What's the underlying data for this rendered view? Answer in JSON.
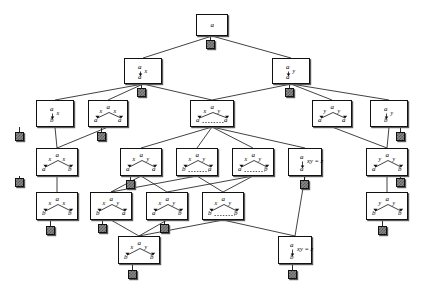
{
  "figure": {
    "type": "tree-diagram",
    "background": "#ffffff",
    "line_color": "#111111",
    "box_fill": "#ffffff",
    "terminal_fill": "#8a8a8a"
  },
  "glyphs": {
    "a": "a",
    "b": "b",
    "x": "x",
    "y": "y",
    "xyz": "xy = z"
  },
  "nodes": [
    {
      "id": "n0",
      "x": 196,
      "y": 14,
      "w": 32,
      "h": 22,
      "kind": "single",
      "top": "a",
      "down": "",
      "left_edge": "",
      "right_edge": "",
      "left_child": "",
      "right_child": "",
      "dashed": false,
      "note": ""
    },
    {
      "id": "n1",
      "x": 124,
      "y": 58,
      "w": 38,
      "h": 26,
      "kind": "arrow",
      "top": "a",
      "down": "a",
      "left_edge": "",
      "right_edge": "x",
      "left_child": "",
      "right_child": "",
      "dashed": false,
      "note": ""
    },
    {
      "id": "n2",
      "x": 272,
      "y": 58,
      "w": 38,
      "h": 26,
      "kind": "arrow",
      "top": "a",
      "down": "a",
      "left_edge": "",
      "right_edge": "y",
      "left_child": "",
      "right_child": "",
      "dashed": false,
      "note": ""
    },
    {
      "id": "n3",
      "x": 36,
      "y": 100,
      "w": 38,
      "h": 27,
      "kind": "arrow",
      "top": "a",
      "down": "b",
      "left_edge": "",
      "right_edge": "x",
      "left_child": "",
      "right_child": "",
      "dashed": false,
      "note": ""
    },
    {
      "id": "n4",
      "x": 88,
      "y": 100,
      "w": 40,
      "h": 27,
      "kind": "fork",
      "top": "a",
      "down": "",
      "left_edge": "x",
      "right_edge": "x",
      "left_child": "a",
      "right_child": "a",
      "dashed": false,
      "note": ""
    },
    {
      "id": "n5",
      "x": 190,
      "y": 100,
      "w": 44,
      "h": 27,
      "kind": "fork",
      "top": "a",
      "down": "",
      "left_edge": "x",
      "right_edge": "y",
      "left_child": "a",
      "right_child": "a",
      "dashed": true,
      "note": ""
    },
    {
      "id": "n6",
      "x": 312,
      "y": 100,
      "w": 40,
      "h": 27,
      "kind": "fork",
      "top": "a",
      "down": "",
      "left_edge": "y",
      "right_edge": "y",
      "left_child": "a",
      "right_child": "a",
      "dashed": false,
      "note": ""
    },
    {
      "id": "n7",
      "x": 370,
      "y": 100,
      "w": 38,
      "h": 27,
      "kind": "arrow",
      "top": "a",
      "down": "b",
      "left_edge": "",
      "right_edge": "y",
      "left_child": "",
      "right_child": "",
      "dashed": false,
      "note": ""
    },
    {
      "id": "n8",
      "x": 36,
      "y": 148,
      "w": 42,
      "h": 28,
      "kind": "fork",
      "top": "a",
      "down": "",
      "left_edge": "x",
      "right_edge": "x",
      "left_child": "a",
      "right_child": "b",
      "dashed": false,
      "note": ""
    },
    {
      "id": "n9",
      "x": 120,
      "y": 148,
      "w": 42,
      "h": 28,
      "kind": "fork",
      "top": "a",
      "down": "",
      "left_edge": "x",
      "right_edge": "y",
      "left_child": "a",
      "right_child": "a",
      "dashed": false,
      "note": ""
    },
    {
      "id": "n10",
      "x": 176,
      "y": 148,
      "w": 42,
      "h": 28,
      "kind": "fork",
      "top": "a",
      "down": "",
      "left_edge": "x",
      "right_edge": "y",
      "left_child": "b",
      "right_child": "a",
      "dashed": true,
      "note": ""
    },
    {
      "id": "n11",
      "x": 232,
      "y": 148,
      "w": 42,
      "h": 28,
      "kind": "fork",
      "top": "a",
      "down": "",
      "left_edge": "x",
      "right_edge": "y",
      "left_child": "a",
      "right_child": "b",
      "dashed": true,
      "note": ""
    },
    {
      "id": "n12",
      "x": 288,
      "y": 148,
      "w": 34,
      "h": 28,
      "kind": "eqarrow",
      "top": "a",
      "down": "a",
      "left_edge": "",
      "right_edge": "",
      "left_child": "",
      "right_child": "",
      "dashed": false,
      "note": "xy = z"
    },
    {
      "id": "n13",
      "x": 366,
      "y": 148,
      "w": 42,
      "h": 28,
      "kind": "fork",
      "top": "a",
      "down": "",
      "left_edge": "y",
      "right_edge": "y",
      "left_child": "a",
      "right_child": "b",
      "dashed": false,
      "note": ""
    },
    {
      "id": "n14",
      "x": 36,
      "y": 192,
      "w": 42,
      "h": 28,
      "kind": "fork",
      "top": "a",
      "down": "",
      "left_edge": "x",
      "right_edge": "x",
      "left_child": "b",
      "right_child": "b",
      "dashed": false,
      "note": ""
    },
    {
      "id": "n15",
      "x": 90,
      "y": 192,
      "w": 42,
      "h": 28,
      "kind": "fork",
      "top": "a",
      "down": "",
      "left_edge": "x",
      "right_edge": "y",
      "left_child": "b",
      "right_child": "a",
      "dashed": false,
      "note": ""
    },
    {
      "id": "n16",
      "x": 146,
      "y": 192,
      "w": 42,
      "h": 28,
      "kind": "fork",
      "top": "a",
      "down": "",
      "left_edge": "x",
      "right_edge": "y",
      "left_child": "a",
      "right_child": "b",
      "dashed": false,
      "note": ""
    },
    {
      "id": "n17",
      "x": 202,
      "y": 192,
      "w": 42,
      "h": 28,
      "kind": "fork",
      "top": "a",
      "down": "",
      "left_edge": "x",
      "right_edge": "y",
      "left_child": "b",
      "right_child": "b",
      "dashed": true,
      "note": ""
    },
    {
      "id": "n18",
      "x": 366,
      "y": 192,
      "w": 42,
      "h": 28,
      "kind": "fork",
      "top": "a",
      "down": "",
      "left_edge": "y",
      "right_edge": "y",
      "left_child": "b",
      "right_child": "b",
      "dashed": false,
      "note": ""
    },
    {
      "id": "n19",
      "x": 118,
      "y": 236,
      "w": 42,
      "h": 28,
      "kind": "fork",
      "top": "a",
      "down": "",
      "left_edge": "x",
      "right_edge": "y",
      "left_child": "b",
      "right_child": "b",
      "dashed": false,
      "note": ""
    },
    {
      "id": "n20",
      "x": 278,
      "y": 236,
      "w": 34,
      "h": 28,
      "kind": "eqarrow",
      "top": "a",
      "down": "b",
      "left_edge": "",
      "right_edge": "",
      "left_child": "",
      "right_child": "",
      "dashed": false,
      "note": "xy = z"
    }
  ],
  "terminals": [
    {
      "id": "t0",
      "x": 206,
      "y": 40,
      "s": 9,
      "parent": "n0"
    },
    {
      "id": "t1",
      "x": 137,
      "y": 88,
      "s": 9,
      "parent": "n1"
    },
    {
      "id": "t2",
      "x": 285,
      "y": 88,
      "s": 9,
      "parent": "n2"
    },
    {
      "id": "t3",
      "x": 15,
      "y": 132,
      "s": 9,
      "parent": "n3"
    },
    {
      "id": "t4",
      "x": 97,
      "y": 132,
      "s": 9,
      "parent": "n4"
    },
    {
      "id": "t5",
      "x": 396,
      "y": 132,
      "s": 9,
      "parent": "n7"
    },
    {
      "id": "t6",
      "x": 15,
      "y": 178,
      "s": 9,
      "parent": "n8"
    },
    {
      "id": "t7",
      "x": 126,
      "y": 180,
      "s": 9,
      "parent": "n9"
    },
    {
      "id": "t8",
      "x": 300,
      "y": 180,
      "s": 9,
      "parent": "n12"
    },
    {
      "id": "t9",
      "x": 396,
      "y": 178,
      "s": 9,
      "parent": "n13"
    },
    {
      "id": "t10",
      "x": 46,
      "y": 226,
      "s": 9,
      "parent": "n14"
    },
    {
      "id": "t11",
      "x": 98,
      "y": 224,
      "s": 9,
      "parent": "n15"
    },
    {
      "id": "t12",
      "x": 160,
      "y": 224,
      "s": 9,
      "parent": "n16"
    },
    {
      "id": "t13",
      "x": 378,
      "y": 226,
      "s": 9,
      "parent": "n18"
    },
    {
      "id": "t14",
      "x": 128,
      "y": 270,
      "s": 9,
      "parent": "n19"
    },
    {
      "id": "t15",
      "x": 288,
      "y": 270,
      "s": 9,
      "parent": "n20"
    }
  ],
  "edges": [
    {
      "from": "n0",
      "to": "n1"
    },
    {
      "from": "n0",
      "to": "n2"
    },
    {
      "from": "n1",
      "to": "n3"
    },
    {
      "from": "n1",
      "to": "n4"
    },
    {
      "from": "n1",
      "to": "n5"
    },
    {
      "from": "n2",
      "to": "n5"
    },
    {
      "from": "n2",
      "to": "n6"
    },
    {
      "from": "n2",
      "to": "n7"
    },
    {
      "from": "n3",
      "to": "n8"
    },
    {
      "from": "n4",
      "to": "n8"
    },
    {
      "from": "n5",
      "to": "n9"
    },
    {
      "from": "n5",
      "to": "n10"
    },
    {
      "from": "n5",
      "to": "n11"
    },
    {
      "from": "n5",
      "to": "n12"
    },
    {
      "from": "n6",
      "to": "n13"
    },
    {
      "from": "n7",
      "to": "n13"
    },
    {
      "from": "n8",
      "to": "n14"
    },
    {
      "from": "n9",
      "to": "n15"
    },
    {
      "from": "n9",
      "to": "n16"
    },
    {
      "from": "n10",
      "to": "n15"
    },
    {
      "from": "n10",
      "to": "n17"
    },
    {
      "from": "n11",
      "to": "n16"
    },
    {
      "from": "n11",
      "to": "n17"
    },
    {
      "from": "n13",
      "to": "n18"
    },
    {
      "from": "n15",
      "to": "n19"
    },
    {
      "from": "n16",
      "to": "n19"
    },
    {
      "from": "n17",
      "to": "n19"
    },
    {
      "from": "n17",
      "to": "n20"
    },
    {
      "from": "n12",
      "to": "n20"
    }
  ]
}
